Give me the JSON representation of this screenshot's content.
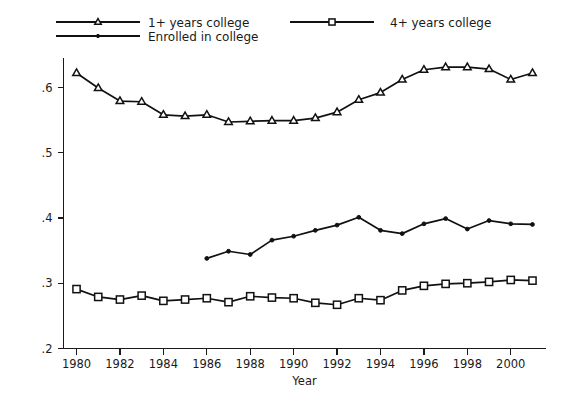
{
  "chart_data": {
    "type": "line",
    "title": "",
    "subtitle": "",
    "xlabel": "Year",
    "ylabel": "",
    "xlim": [
      1979.4,
      2001.6
    ],
    "ylim": [
      0.2,
      0.645
    ],
    "grid": false,
    "legend_position": "top",
    "x_ticks": [
      1980,
      1982,
      1984,
      1986,
      1988,
      1990,
      1992,
      1994,
      1996,
      1998,
      2000
    ],
    "x_tick_labels": [
      "1980",
      "1982",
      "1984",
      "1986",
      "1988",
      "1990",
      "1992",
      "1994",
      "1996",
      "1998",
      "2000"
    ],
    "x_minor_ticks": [
      1981,
      1983,
      1985,
      1987,
      1989,
      1991,
      1993,
      1995,
      1997,
      1999,
      2001
    ],
    "y_ticks": [
      0.2,
      0.3,
      0.4,
      0.5,
      0.6
    ],
    "y_tick_labels": [
      ".2",
      ".3",
      ".4",
      ".5",
      ".6"
    ],
    "series": [
      {
        "name": "1+ years college",
        "marker": "triangle",
        "x": [
          1980,
          1981,
          1982,
          1983,
          1984,
          1985,
          1986,
          1987,
          1988,
          1989,
          1990,
          1991,
          1992,
          1993,
          1994,
          1995,
          1996,
          1997,
          1998,
          1999,
          2000,
          2001
        ],
        "values": [
          0.622,
          0.599,
          0.579,
          0.578,
          0.558,
          0.556,
          0.558,
          0.547,
          0.548,
          0.549,
          0.549,
          0.553,
          0.562,
          0.581,
          0.592,
          0.612,
          0.627,
          0.631,
          0.631,
          0.628,
          0.612,
          0.622
        ]
      },
      {
        "name": "Enrolled in college",
        "marker": "dot",
        "x": [
          1986,
          1987,
          1988,
          1989,
          1990,
          1991,
          1992,
          1993,
          1994,
          1995,
          1996,
          1997,
          1998,
          1999,
          2000,
          2001
        ],
        "values": [
          0.338,
          0.349,
          0.344,
          0.366,
          0.372,
          0.381,
          0.389,
          0.401,
          0.381,
          0.376,
          0.391,
          0.399,
          0.383,
          0.396,
          0.391,
          0.39
        ]
      },
      {
        "name": "4+ years college",
        "marker": "square",
        "x": [
          1980,
          1981,
          1982,
          1983,
          1984,
          1985,
          1986,
          1987,
          1988,
          1989,
          1990,
          1991,
          1992,
          1993,
          1994,
          1995,
          1996,
          1997,
          1998,
          1999,
          2000,
          2001
        ],
        "values": [
          0.291,
          0.279,
          0.275,
          0.281,
          0.273,
          0.275,
          0.277,
          0.271,
          0.28,
          0.278,
          0.277,
          0.27,
          0.267,
          0.277,
          0.274,
          0.289,
          0.296,
          0.299,
          0.3,
          0.302,
          0.305,
          0.304
        ]
      }
    ]
  },
  "legend": {
    "entries": [
      {
        "label": "1+ years college",
        "marker": "triangle"
      },
      {
        "label": "Enrolled in college",
        "marker": "dot"
      },
      {
        "label": "4+ years college",
        "marker": "square"
      }
    ]
  },
  "colors": {
    "ink": "#111111",
    "background": "#ffffff"
  }
}
